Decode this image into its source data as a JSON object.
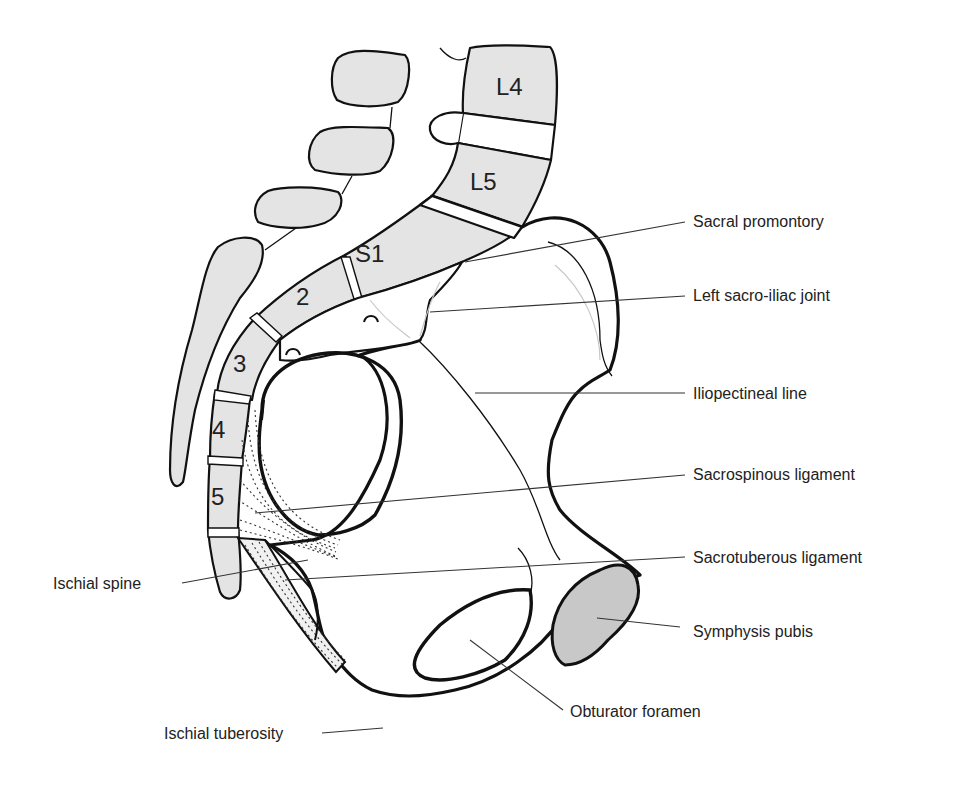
{
  "diagram": {
    "colors": {
      "bone_fill": "#e4e4e4",
      "pubis_fill": "#c8c8c8",
      "outline": "#111111",
      "label_text": "#222222",
      "background": "#ffffff"
    },
    "vertebra_labels": {
      "l4": "L4",
      "l5": "L5",
      "s1": "S1",
      "s2": "2",
      "s3": "3",
      "s4": "4",
      "s5": "5"
    },
    "labels": [
      {
        "id": "sacral-promontory",
        "text": "Sacral promontory",
        "side": "right"
      },
      {
        "id": "left-sacro-iliac-joint",
        "text": "Left sacro-iliac joint",
        "side": "right"
      },
      {
        "id": "iliopectineal-line",
        "text": "Iliopectineal line",
        "side": "right"
      },
      {
        "id": "sacrospinous-ligament",
        "text": "Sacrospinous ligament",
        "side": "right"
      },
      {
        "id": "sacrotuberous-ligament",
        "text": "Sacrotuberous ligament",
        "side": "right"
      },
      {
        "id": "symphysis-pubis",
        "text": "Symphysis pubis",
        "side": "right"
      },
      {
        "id": "obturator-foramen",
        "text": "Obturator foramen",
        "side": "bottom"
      },
      {
        "id": "ischial-spine",
        "text": "Ischial spine",
        "side": "left"
      },
      {
        "id": "ischial-tuberosity",
        "text": "Ischial tuberosity",
        "side": "left"
      }
    ]
  }
}
